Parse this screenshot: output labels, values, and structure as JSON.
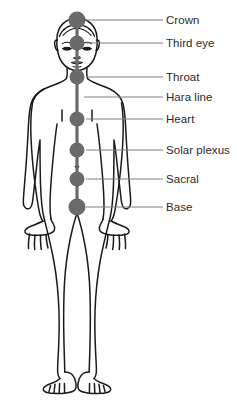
{
  "diagram": {
    "background_color": "#ffffff",
    "outline_color": "#1a1a1a",
    "point_color": "#6a6a6a",
    "leader_color": "#808080",
    "text_color": "#2b2b2b",
    "figure": {
      "name": "human-body-front-outline",
      "pose": "standing front view, arms at sides, legs apart"
    },
    "hara_line": {
      "name": "hara-line",
      "description": "vertical central energy line running through all points",
      "color": "#6a6a6a",
      "x": 77,
      "y_top": 20,
      "y_bottom": 209
    },
    "labels": [
      {
        "id": "crown",
        "text": "Crown",
        "y": 20,
        "text_x": 166,
        "text_y": 14,
        "leader_from_x": 86,
        "leader_to_x": 163,
        "has_point": true,
        "point_x": 77,
        "point_y": 20,
        "point_r": 8.5
      },
      {
        "id": "third-eye",
        "text": "Third eye",
        "y": 43,
        "text_x": 166,
        "text_y": 37,
        "leader_from_x": 86,
        "leader_to_x": 163,
        "has_point": true,
        "point_x": 77,
        "point_y": 43,
        "point_r": 7.5
      },
      {
        "id": "throat",
        "text": "Throat",
        "y": 77,
        "text_x": 166,
        "text_y": 71,
        "leader_from_x": 86,
        "leader_to_x": 163,
        "has_point": true,
        "point_x": 77,
        "point_y": 77,
        "point_r": 7.5
      },
      {
        "id": "hara-line",
        "text": "Hara line",
        "y": 97,
        "text_x": 166,
        "text_y": 91,
        "leader_from_x": 84,
        "leader_to_x": 163,
        "has_point": false,
        "point_x": 77,
        "point_y": 97,
        "point_r": 0
      },
      {
        "id": "heart",
        "text": "Heart",
        "y": 119,
        "text_x": 166,
        "text_y": 113,
        "leader_from_x": 86,
        "leader_to_x": 163,
        "has_point": true,
        "point_x": 77,
        "point_y": 119,
        "point_r": 7.5
      },
      {
        "id": "solar-plexus",
        "text": "Solar plexus",
        "y": 150,
        "text_x": 166,
        "text_y": 144,
        "leader_from_x": 86,
        "leader_to_x": 163,
        "has_point": true,
        "point_x": 77,
        "point_y": 150,
        "point_r": 7.5
      },
      {
        "id": "sacral",
        "text": "Sacral",
        "y": 179,
        "text_x": 166,
        "text_y": 173,
        "leader_from_x": 86,
        "leader_to_x": 163,
        "has_point": true,
        "point_x": 77,
        "point_y": 179,
        "point_r": 7.5
      },
      {
        "id": "base",
        "text": "Base",
        "y": 207,
        "text_x": 166,
        "text_y": 201,
        "leader_from_x": 86,
        "leader_to_x": 163,
        "has_point": true,
        "point_x": 77,
        "point_y": 207,
        "point_r": 8.5
      }
    ]
  }
}
